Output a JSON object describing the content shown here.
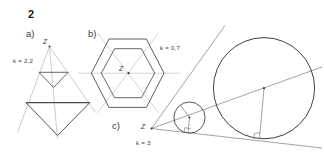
{
  "figure": {
    "exercise_number": "2",
    "parts": [
      {
        "id": "a",
        "label": "a)",
        "ratio_label": "k = 2,2",
        "center_label": "Z",
        "shape": "triangle"
      },
      {
        "id": "b",
        "label": "b)",
        "ratio_label": "k = 0,7",
        "center_label": "Z",
        "shape": "hexagon"
      },
      {
        "id": "c",
        "label": "c)",
        "ratio_label": "k = 3",
        "center_label": "Z",
        "shape": "circle"
      }
    ],
    "colors": {
      "ink": "#4a4a52",
      "ray": "#b9b9c0",
      "text": "#2b2b2b",
      "page": "#ffffff"
    }
  }
}
